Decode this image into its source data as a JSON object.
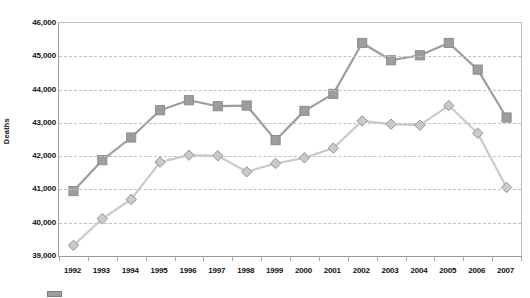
{
  "chart_data": {
    "type": "line",
    "title": "",
    "subtitle": "",
    "xlabel": "",
    "ylabel": "Deaths",
    "categories": [
      "1992",
      "1993",
      "1994",
      "1995",
      "1996",
      "1997",
      "1998",
      "1999",
      "2000",
      "2001",
      "2002",
      "2003",
      "2004",
      "2005",
      "2006",
      "2007"
    ],
    "ylim": [
      39000,
      46000
    ],
    "ytick_step": 1000,
    "ytick_labels": [
      "46,000",
      "45,000",
      "44,000",
      "43,000",
      "42,000",
      "41,000",
      "40,000",
      "39,000"
    ],
    "ytick_values": [
      46000,
      45000,
      44000,
      43000,
      42000,
      41000,
      40000,
      39000
    ],
    "grid": true,
    "grid_style": "dashed-horizontal",
    "legend_position": "bottom-left",
    "series": [
      {
        "name": "series-squares",
        "marker": "square",
        "color": "#9d9d9d",
        "line_color": "#9d9d9d",
        "values": [
          40950,
          41880,
          42560,
          43380,
          43680,
          43500,
          43520,
          42480,
          43360,
          43870,
          45400,
          44880,
          45030,
          45400,
          44600,
          43160
        ]
      },
      {
        "name": "series-diamonds",
        "marker": "diamond",
        "color": "#cacaca",
        "line_color": "#cacaca",
        "values": [
          39320,
          40120,
          40700,
          41820,
          42030,
          42010,
          41530,
          41780,
          41950,
          42240,
          43060,
          42960,
          42930,
          43520,
          42690,
          41060
        ]
      }
    ],
    "annotations": []
  },
  "legend": {
    "swatch_color": "#9d9d9d"
  }
}
